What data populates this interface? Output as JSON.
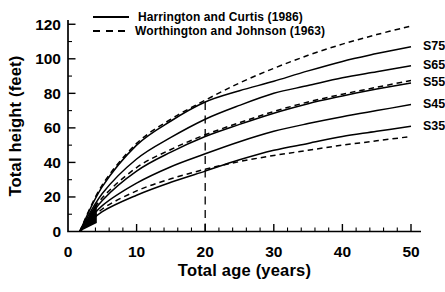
{
  "chart_data": {
    "type": "line",
    "title": "",
    "xlabel": "Total age (years)",
    "ylabel": "Total height (feet)",
    "xlim": [
      0,
      51.5
    ],
    "ylim": [
      0,
      124
    ],
    "x_ticks": [
      0,
      10,
      20,
      30,
      40,
      50
    ],
    "y_ticks": [
      0,
      20,
      40,
      60,
      80,
      100,
      120
    ],
    "x_minor_step": 2,
    "y_minor_step": 10,
    "grid": "off",
    "legend_position": "top-left-inside",
    "legend": [
      {
        "label": "Harrington and Curtis (1986)",
        "style": "solid"
      },
      {
        "label": "Worthington and Johnson (1963)",
        "style": "dashed"
      }
    ],
    "reference_line": {
      "axis": "x",
      "value": 20,
      "to_height": 76,
      "style": "long-dash"
    },
    "ages": [
      1.7,
      5,
      10,
      15,
      20,
      25,
      30,
      35,
      40,
      45,
      50
    ],
    "series": [
      {
        "name": "Harrington and Curtis S75",
        "label": "S75",
        "source": "Harrington and Curtis (1986)",
        "site_index": 75,
        "style": "solid",
        "heights": [
          0,
          26,
          50,
          64,
          75,
          81.5,
          87,
          93,
          98.5,
          103,
          107
        ]
      },
      {
        "name": "Harrington and Curtis S65",
        "label": "S65",
        "source": "Harrington and Curtis (1986)",
        "site_index": 65,
        "style": "solid",
        "heights": [
          0,
          22,
          42,
          54.5,
          65,
          73,
          80,
          84.5,
          89,
          92.5,
          96
        ]
      },
      {
        "name": "Harrington and Curtis S55",
        "label": "S55",
        "source": "Harrington and Curtis (1986)",
        "site_index": 55,
        "style": "solid",
        "heights": [
          0,
          18,
          35,
          46,
          55,
          62,
          68.5,
          74,
          78.5,
          82.5,
          86
        ]
      },
      {
        "name": "Harrington and Curtis S45",
        "label": "S45",
        "source": "Harrington and Curtis (1986)",
        "site_index": 45,
        "style": "solid",
        "heights": [
          0,
          15,
          28,
          37.5,
          45,
          52,
          58,
          62.5,
          66.5,
          70,
          73.5
        ]
      },
      {
        "name": "Harrington and Curtis S35",
        "label": "S35",
        "source": "Harrington and Curtis (1986)",
        "site_index": 35,
        "style": "solid",
        "heights": [
          0,
          11.5,
          21,
          28.5,
          35,
          41.5,
          47,
          51,
          55,
          58,
          61
        ]
      },
      {
        "name": "Worthington and Johnson S75",
        "label": "",
        "source": "Worthington and Johnson (1963)",
        "site_index": 75,
        "style": "dashed",
        "heights": [
          0,
          27,
          51,
          65,
          76,
          86,
          94.5,
          102,
          108.5,
          114,
          119
        ]
      },
      {
        "name": "Worthington and Johnson S55",
        "label": "",
        "source": "Worthington and Johnson (1963)",
        "site_index": 55,
        "style": "dashed",
        "heights": [
          0,
          19.5,
          37,
          47.5,
          56,
          63,
          69.5,
          75,
          79.5,
          83.5,
          87.5
        ]
      },
      {
        "name": "Worthington and Johnson S35",
        "label": "",
        "source": "Worthington and Johnson (1963)",
        "site_index": 35,
        "style": "dashed",
        "heights": [
          0,
          13,
          23.5,
          30.5,
          36,
          40.5,
          44,
          47,
          50,
          52.5,
          55
        ]
      }
    ]
  }
}
